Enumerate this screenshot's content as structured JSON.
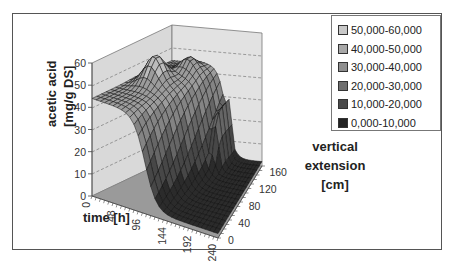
{
  "chart_data": {
    "type": "surface3d",
    "title": "",
    "xlabel": "time [h]",
    "ylabel": "acetic acid [mg/g DS]",
    "zlabel": "vertical extension [cm]",
    "x_ticks": [
      "0",
      "48",
      "96",
      "144",
      "192",
      "240"
    ],
    "y_ticks": [
      "0",
      "10",
      "20",
      "30",
      "40",
      "50",
      "60"
    ],
    "z_ticks": [
      "0",
      "40",
      "80",
      "120",
      "160"
    ],
    "ylim": [
      0,
      60
    ],
    "legend_position": "top-right",
    "legend": [
      {
        "label": "50,000-60,000",
        "color": "#c8c8c8"
      },
      {
        "label": "40,000-50,000",
        "color": "#a8a8a8"
      },
      {
        "label": "30,000-40,000",
        "color": "#8e8e8e"
      },
      {
        "label": "20,000-30,000",
        "color": "#6e6e6e"
      },
      {
        "label": "10,000-20,000",
        "color": "#4a4a4a"
      },
      {
        "label": "0,000-10,000",
        "color": "#222222"
      }
    ],
    "surface_description": "Acetic acid concentration high (~40-55 mg/g DS) at early times across all heights with a peak near 55-60 at upper heights early; drops sharply to near 0 after ~96-144 h, with a residual ridge (~30-35) at high vertical extension around 144-192 h."
  },
  "labels": {
    "ylabel_line1": "acetic acid",
    "ylabel_line2": "[mg/g DS]",
    "xlabel": "time [h]",
    "zlabel_line1": "vertical",
    "zlabel_line2": "extension",
    "zlabel_line3": "[cm]"
  }
}
